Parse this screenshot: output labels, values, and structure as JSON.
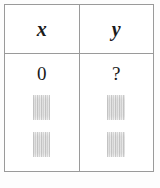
{
  "table": {
    "columns": [
      {
        "key": "x",
        "header": "x"
      },
      {
        "key": "y",
        "header": "y"
      }
    ],
    "rows": [
      {
        "x": "0",
        "y": "?"
      }
    ],
    "obscured_cells": [
      {
        "column": "x",
        "content": "",
        "state": "blurred"
      },
      {
        "column": "y",
        "content": "",
        "state": "blurred"
      },
      {
        "column": "x",
        "content": "",
        "state": "blurred"
      },
      {
        "column": "y",
        "content": "",
        "state": "blurred"
      }
    ]
  },
  "colors": {
    "border": "#9a9a9a",
    "text": "#1a1a1a",
    "background": "#ffffff",
    "page_background": "#fdfdfd",
    "redaction": "#c8c8c8"
  }
}
